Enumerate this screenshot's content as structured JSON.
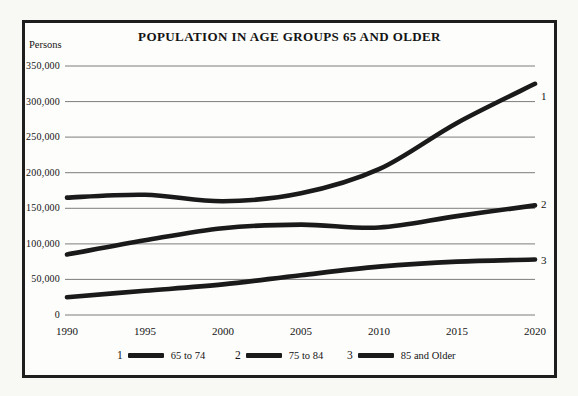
{
  "colors": {
    "line": "#1a1a1a",
    "grid": "#7d7d7d",
    "frame_border": "#1e1e1e",
    "panel_bg": "#fdfdfb",
    "page_bg": "#f8f8f5",
    "text": "#141414"
  },
  "chart_data": {
    "type": "line",
    "title": "POPULATION IN AGE GROUPS 65 AND OLDER",
    "ylabel": "Persons",
    "xlabel": "",
    "x": [
      1990,
      1995,
      2000,
      2005,
      2010,
      2015,
      2020
    ],
    "x_tick_labels": [
      "1990",
      "1995",
      "2000",
      "2005",
      "2010",
      "2015",
      "2020"
    ],
    "y_ticks": [
      0,
      50000,
      100000,
      150000,
      200000,
      250000,
      300000,
      350000
    ],
    "y_tick_labels": [
      "0",
      "50,000",
      "100,000",
      "150,000",
      "200,000",
      "250,000",
      "300,000",
      "350,000"
    ],
    "ylim": [
      0,
      350000
    ],
    "xlim": [
      1990,
      2020
    ],
    "grid": "horizontal",
    "legend_position": "bottom",
    "series": [
      {
        "id": "1",
        "name": "65 to 74",
        "values": [
          165000,
          169000,
          160000,
          171000,
          205000,
          270000,
          325000
        ]
      },
      {
        "id": "2",
        "name": "75 to 84",
        "values": [
          85000,
          105000,
          122000,
          127000,
          123000,
          139000,
          154000
        ]
      },
      {
        "id": "3",
        "name": "85 and Older",
        "values": [
          25000,
          34000,
          43000,
          56000,
          68000,
          75000,
          78000
        ]
      }
    ]
  }
}
